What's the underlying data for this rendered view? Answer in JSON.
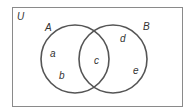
{
  "diagram": {
    "type": "venn",
    "universe_label": "U",
    "sets": [
      {
        "label": "A",
        "cx": 75,
        "cy": 59,
        "r": 34
      },
      {
        "label": "B",
        "cx": 113,
        "cy": 59,
        "r": 34
      }
    ],
    "elements": [
      {
        "label": "a",
        "region": "A only"
      },
      {
        "label": "b",
        "region": "A only"
      },
      {
        "label": "c",
        "region": "A and B"
      },
      {
        "label": "d",
        "region": "B only"
      },
      {
        "label": "e",
        "region": "B only"
      }
    ],
    "colors": {
      "stroke": "#555555",
      "border": "#888888",
      "text": "#333333"
    }
  }
}
